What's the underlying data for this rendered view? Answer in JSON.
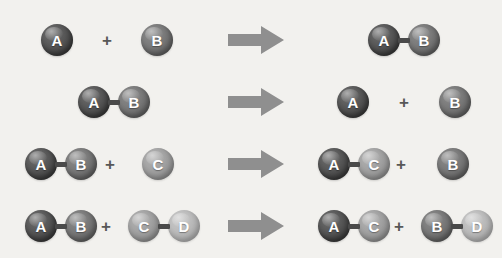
{
  "figure": {
    "background_color": "#f2f1ee",
    "arrow_color": "#8f8f8f",
    "bond_color": "#4a4a4a",
    "plus_color": "#585858",
    "label_color": "#ffffff",
    "width": 502,
    "height": 258
  },
  "atom_types": {
    "A": {
      "label": "A",
      "color": "#4c4c4c",
      "shade": "shade-a"
    },
    "B": {
      "label": "B",
      "color": "#6e6e6e",
      "shade": "shade-b"
    },
    "C": {
      "label": "C",
      "color": "#9a9a9a",
      "shade": "shade-c"
    },
    "D": {
      "label": "D",
      "color": "#b5b5b5",
      "shade": "shade-d"
    }
  },
  "symbols": {
    "plus": "+",
    "arrow": "right-block-arrow"
  },
  "chart_data": {
    "type": "diagram",
    "notation": "Spheres labeled A, B, C, D represent atoms; short bars represent chemical bonds; block arrows mean 'yields'.",
    "reactions": [
      {
        "index": 1,
        "name": "synthesis",
        "equation": "A + B -> AB",
        "reactants": [
          "A",
          "B"
        ],
        "products": [
          "AB"
        ]
      },
      {
        "index": 2,
        "name": "decomposition",
        "equation": "AB -> A + B",
        "reactants": [
          "AB"
        ],
        "products": [
          "A",
          "B"
        ]
      },
      {
        "index": 3,
        "name": "single replacement",
        "equation": "AB + C -> AC + B",
        "reactants": [
          "AB",
          "C"
        ],
        "products": [
          "AC",
          "B"
        ]
      },
      {
        "index": 4,
        "name": "double replacement",
        "equation": "AB + CD -> AC + BD",
        "reactants": [
          "AB",
          "CD"
        ],
        "products": [
          "AC",
          "BD"
        ]
      }
    ]
  },
  "rows": [
    {
      "name": "synthesis",
      "top": 8,
      "reactants": {
        "molecules": [
          {
            "left": 41,
            "atoms": [
              "A"
            ]
          },
          {
            "left": 141,
            "atoms": [
              "B"
            ]
          }
        ],
        "plus": [
          {
            "left": 107
          }
        ]
      },
      "arrow": {
        "left": 228
      },
      "products": {
        "molecules": [
          {
            "left": 368,
            "atoms": [
              "A",
              "B"
            ]
          }
        ],
        "plus": []
      }
    },
    {
      "name": "decomposition",
      "top": 70,
      "reactants": {
        "molecules": [
          {
            "left": 78,
            "atoms": [
              "A",
              "B"
            ]
          }
        ],
        "plus": []
      },
      "arrow": {
        "left": 228
      },
      "products": {
        "molecules": [
          {
            "left": 337,
            "atoms": [
              "A"
            ]
          },
          {
            "left": 439,
            "atoms": [
              "B"
            ]
          }
        ],
        "plus": [
          {
            "left": 404
          }
        ]
      }
    },
    {
      "name": "single-replacement",
      "top": 132,
      "reactants": {
        "molecules": [
          {
            "left": 25,
            "atoms": [
              "A",
              "B"
            ]
          },
          {
            "left": 142,
            "atoms": [
              "C"
            ]
          }
        ],
        "plus": [
          {
            "left": 110
          }
        ]
      },
      "arrow": {
        "left": 228
      },
      "products": {
        "molecules": [
          {
            "left": 318,
            "atoms": [
              "A",
              "C"
            ]
          },
          {
            "left": 437,
            "atoms": [
              "B"
            ]
          }
        ],
        "plus": [
          {
            "left": 401
          }
        ]
      }
    },
    {
      "name": "double-replacement",
      "top": 194,
      "reactants": {
        "molecules": [
          {
            "left": 25,
            "atoms": [
              "A",
              "B"
            ]
          },
          {
            "left": 128,
            "atoms": [
              "C",
              "D"
            ]
          }
        ],
        "plus": [
          {
            "left": 106
          }
        ]
      },
      "arrow": {
        "left": 228
      },
      "products": {
        "molecules": [
          {
            "left": 318,
            "atoms": [
              "A",
              "C"
            ]
          },
          {
            "left": 421,
            "atoms": [
              "B",
              "D"
            ]
          }
        ],
        "plus": [
          {
            "left": 399
          }
        ]
      }
    }
  ]
}
